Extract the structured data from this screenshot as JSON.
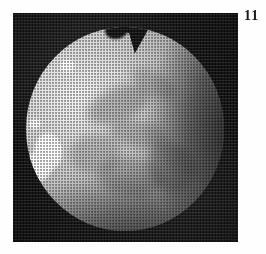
{
  "page": {
    "background_color": "#fefefe"
  },
  "figure": {
    "number_label": "11",
    "plate": {
      "background_color": "#090909",
      "left": 13,
      "top": 13,
      "width": 225,
      "height": 229,
      "print_style": "halftone-screen"
    },
    "subject": {
      "name": "planetary-disk",
      "description": "bright circular planetary disk photographed against a black sky",
      "disk_color_bright": "#f2f2f2",
      "disk_color_dark": "#151515",
      "terminator_side": "right",
      "features": [
        {
          "name": "top-notch",
          "kind": "notch",
          "position": "top-center"
        },
        {
          "name": "bright-blob-upper-left",
          "kind": "bright-spot",
          "position": "upper-left-limb"
        },
        {
          "name": "bright-blob-left-small",
          "kind": "bright-spot",
          "position": "left-limb"
        },
        {
          "name": "bright-blob-left-large",
          "kind": "bright-spot",
          "position": "left-limb"
        },
        {
          "name": "bright-blob-left-lower",
          "kind": "bright-spot",
          "position": "lower-left-limb"
        },
        {
          "name": "albedo-marking-1",
          "kind": "dark-marking",
          "position": "upper-center"
        },
        {
          "name": "albedo-marking-2",
          "kind": "dark-marking",
          "position": "center"
        },
        {
          "name": "albedo-marking-3",
          "kind": "dark-marking",
          "position": "center-left"
        },
        {
          "name": "albedo-marking-4",
          "kind": "dark-marking",
          "position": "upper-right"
        },
        {
          "name": "albedo-marking-5",
          "kind": "dark-marking",
          "position": "lower-center"
        },
        {
          "name": "albedo-marking-6",
          "kind": "dark-marking",
          "position": "lower-right"
        }
      ]
    }
  }
}
